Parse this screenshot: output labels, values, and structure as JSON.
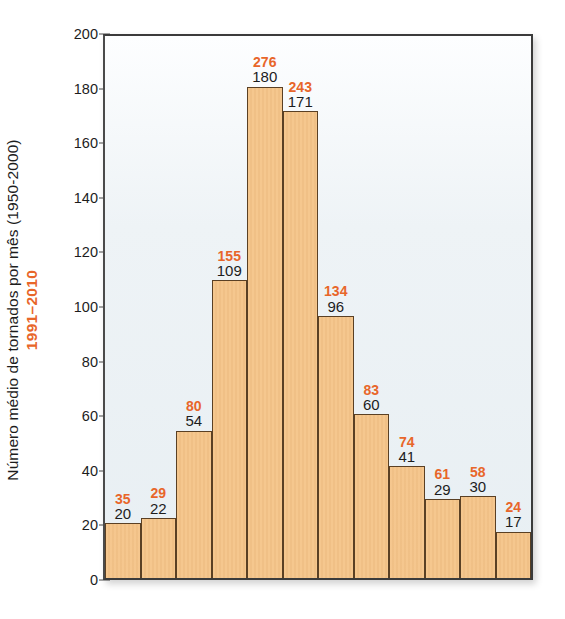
{
  "axis": {
    "y_title_line1": "Número médio de tornados por mês (1950-2000)",
    "y_title_line2": "1991–2010",
    "y_ticks": [
      "200",
      "180",
      "160",
      "140",
      "120",
      "100",
      "80",
      "60",
      "40",
      "20",
      "0"
    ]
  },
  "colors": {
    "series_1991_2010": "#E8662A",
    "series_1950_2000": "#1d1d1d",
    "bar_fill": "#F5C489",
    "bar_outline": "#5a4024",
    "plot_background": "#e8eff3"
  },
  "chart_data": {
    "type": "bar",
    "title": "",
    "xlabel": "",
    "ylabel": "Número médio de tornados por mês (1950-2000) / 1991–2010",
    "ylim": [
      0,
      200
    ],
    "ytick_step": 20,
    "grid": false,
    "legend_position": "none",
    "categories": [
      "1",
      "2",
      "3",
      "4",
      "5",
      "6",
      "7",
      "8",
      "9",
      "10",
      "11",
      "12"
    ],
    "series": [
      {
        "name": "1991–2010",
        "color": "#E8662A",
        "label_position": "above-bar-top",
        "values": [
          35,
          29,
          80,
          155,
          276,
          243,
          134,
          83,
          74,
          61,
          58,
          24
        ]
      },
      {
        "name": "1950-2000",
        "color": "#1d1d1d",
        "label_position": "above-bar-second-line",
        "drawn_as_bar_height": true,
        "values": [
          20,
          22,
          54,
          109,
          180,
          171,
          96,
          60,
          41,
          29,
          30,
          17
        ]
      }
    ]
  }
}
